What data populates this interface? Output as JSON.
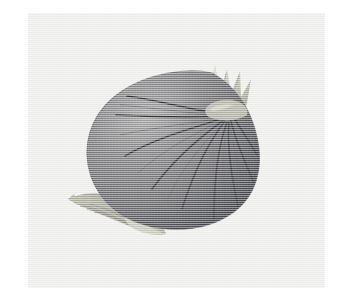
{
  "canvas": {
    "width": 353,
    "height": 299,
    "page_background": "#ffffff",
    "alt_text": "Illustration of a whole onion with dried papery skin, ribbed lines, a spiky dried neck at the top and a small root tuft at the lower left"
  },
  "photo": {
    "name": "onion-illustration",
    "subject": "onion",
    "style": "halftone grayscale illustration on off-white paper",
    "frame": {
      "left": 28,
      "top": 13,
      "width": 297,
      "height": 275,
      "background_color": "#eeeeec"
    }
  },
  "palette": {
    "paper": "#eeeeec",
    "paper_shade": "#e7e7e4",
    "bulb_light": "#8d8d8e",
    "bulb_mid": "#797a7c",
    "bulb_dark": "#5f6063",
    "bulb_darkest": "#4e4f53",
    "bulb_edge": "#45464a",
    "rib_line": "#32333a",
    "neck_light": "#c6c5bd",
    "neck_mid": "#b3b2a8",
    "neck_dark": "#9b9a90",
    "root_light": "#b8b7ae",
    "root_mid": "#9a9990",
    "root_dark": "#7d7c74"
  },
  "parts": [
    {
      "id": "bulb-body",
      "label": "Onion bulb body",
      "note": "teardrop bulb, lit from upper-left, shadow on lower-right"
    },
    {
      "id": "bulb-ribs",
      "label": "Skin rib lines",
      "count": 9,
      "note": "dark curved lines radiating from the neck down across the bulb"
    },
    {
      "id": "neck-tuft",
      "label": "Dried neck leaves",
      "note": "pale tan spiky crown at upper right of the bulb"
    },
    {
      "id": "root-tuft",
      "label": "Root tuft",
      "note": "pale tan fibrous root cluster at the lower left of the bulb"
    }
  ],
  "chart_data": null
}
